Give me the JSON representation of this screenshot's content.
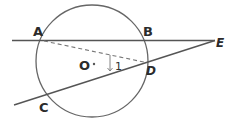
{
  "diagram": {
    "type": "circle-secant-geometry",
    "points": {
      "A": "A",
      "B": "B",
      "C": "C",
      "D": "D",
      "E": "E",
      "O": "O"
    },
    "angle_label": "1",
    "colors": {
      "stroke": "#555555",
      "text": "#2b2b2b"
    }
  }
}
